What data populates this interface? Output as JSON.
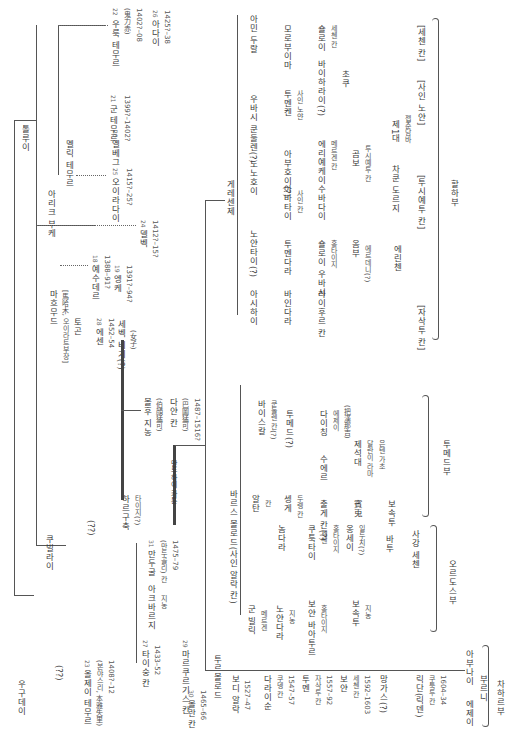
{
  "diagram": {
    "type": "genealogy-tree",
    "orientation": "rotated-90",
    "root": "톨루이",
    "nodes": {
      "tolui": "톨루이",
      "arik_boke": "아리크 부케",
      "melik_temur": "멜릭 테무르",
      "yesuder": {
        "num": "18",
        "name": "예수데르",
        "years": "1388–91?"
      },
      "engke": {
        "num": "19",
        "name": "엥케",
        "years": "1391?–94?"
      },
      "elbeg": {
        "num": "20",
        "name": "엘베그"
      },
      "gun_temur": {
        "num": "21",
        "name": "군 테무르",
        "years": "1399?–1402?"
      },
      "oljei_temur_g": {
        "num": "22",
        "name": "우룩 테무르",
        "sub": "(鬼力赤)",
        "years": "1402?–08"
      },
      "adai": {
        "num": "26",
        "name": "아다이",
        "years": "1425?–38"
      },
      "delbeg": {
        "num": "24",
        "name": "델벡",
        "years": "1412?–15?"
      },
      "oyiradai": {
        "num": "25",
        "name": "오이라다이",
        "years": "1415?–25?"
      },
      "mahmud": {
        "name": "마흐무드",
        "sub": "[馬哈木, 오이라트부장]"
      },
      "toghon": {
        "name": "토곤"
      },
      "esen": {
        "num": "28",
        "name": "에센",
        "years": "1452–54"
      },
      "sebeg_bigi": {
        "name": "세벡 비기(?)",
        "sub": "(女子)"
      },
      "bolhu_jinong": {
        "name": "볼후 지농",
        "sub": "(伯顔猛可)"
      },
      "dayan_khan": {
        "name": "다얀 칸",
        "sub": "(巴圖猛可)",
        "years": "1487–1516?"
      },
      "manduhai": "만두하이 카툰",
      "khubilai": "쿠빌라이",
      "ugedei": "우구데이",
      "q1": "(??)",
      "q2": "(??)",
      "oljei_temur": {
        "num": "23",
        "name": "올제이 테무르",
        "sub": "(본야스리, 本雅失里)",
        "years": "1408?–12"
      },
      "harguchuk": {
        "name": "하르구축",
        "sub": "타이지(?)"
      },
      "manduul": {
        "num": "31",
        "name": "만두굴",
        "sub": "(만두골리) 칸",
        "years": "1475–79"
      },
      "agbarjin": {
        "name": "아크바르지",
        "sub": "지농"
      },
      "taisung": {
        "num": "27",
        "name": "타이숭 칸",
        "years": "1433–52"
      },
      "markorgis": {
        "num": "29",
        "name": "마르쿠르기스 칸"
      },
      "molon": {
        "num": "30",
        "name": "몰란 칸",
        "years": "1465–66"
      },
      "barsbolod": "바르스 볼로드(사인 알락 칸)",
      "torobolod": "투르볼로드",
      "bodi_alag": {
        "name": "보디 알락",
        "years": "1527–47"
      },
      "daraisun": {
        "name": "다라이순",
        "sub": "쿠뎅 칸",
        "years": "1547–57"
      },
      "tumen": {
        "name": "투멘",
        "sub": "자삭투 칸",
        "years": "1557–92"
      },
      "buyan": {
        "name": "보얀",
        "sub": "세첸 칸",
        "years": "1592–1603"
      },
      "mangus": "망가스(?)",
      "ligdan": {
        "name": "릭단(릭덴)",
        "sub": "쿠툭투 칸",
        "years": "1604–34"
      },
      "eje": "에제이",
      "abunai": "아부나이",
      "burni": "부르니",
      "chahar": "차하르부",
      "gun_bilig": {
        "name": "군 빌릭",
        "sub": "메르겐"
      },
      "noyandara": {
        "name": "노얀다라",
        "sub": "지농"
      },
      "nomdara": "놈다라",
      "buyan_bagatur": {
        "name": "보얀 바아투르",
        "sub": "홍타이지"
      },
      "khutugtai": {
        "name": "쿠툭타이",
        "sub": "세첸",
        "sub2": "홍타이지"
      },
      "boshugtu": {
        "name": "보속투",
        "sub": "지농"
      },
      "ongjei": {
        "name": "옹세이",
        "sub": "일두치(?)"
      },
      "bakhu": "바투",
      "sagang": "사강 세첸",
      "ordos": "오르도스부",
      "alchu": {
        "name": "알추",
        "sub": "칸"
      },
      "bayaskhan": {
        "name": "바이스칼",
        "sub": "쿤둘렌 칸(?)"
      },
      "altan": {
        "name": "알탄",
        "sub": "칸"
      },
      "sengge": {
        "name": "셍게",
        "sub": "두렝 칸"
      },
      "tumed_q": "투메드(?)",
      "chokhur": "출게 칸(?)",
      "sutei": "수에르",
      "dayichin": {
        "name": "다이칭",
        "sub": "에제이",
        "sub2": "(把漢那吉)"
      },
      "jesed": {
        "name": "제석대",
        "sub": "달란이 라마",
        "sub2": "은텐 가초"
      },
      "bushu": "賓兎",
      "boshugtu2": "보속투",
      "tumed": "투메드부",
      "gere_senje": "게레센제",
      "ashikhai": "아시하이",
      "noyantai": "노얀타이(?)",
      "nonokhoi": "노노호이",
      "amin_durag": "아민 두랄",
      "ubashi_khong": "우바시 쿤둘렌(?)",
      "bayindara": "바인다라",
      "tumendara": "투멘다라",
      "laikhor": "라이후르 칸",
      "sholoi": {
        "name": "숄로이 우바시",
        "sub": "홍타이지"
      },
      "ombo": {
        "name": "옴부",
        "sub": "에르데니(?)"
      },
      "erinchen": "에린첸",
      "jasagtu_q": "[자삭투 칸]",
      "abatai": {
        "name": "아바타이",
        "sub": "사인 칸"
      },
      "suldai": "수바다이",
      "eriyekhei": {
        "name": "에리예케이",
        "sub": "메르겐 칸"
      },
      "gombo": {
        "name": "곰보",
        "sub": "투시예투 칸"
      },
      "chakhundorji": "차쿤 도르지",
      "tushiyetu": "[투시예투 칸]",
      "jebtsundamba": {
        "name": "제1대",
        "sub": "젭춘담바"
      },
      "abukhui": "아부호이(?)",
      "tumengken": {
        "name": "투멘켄",
        "sub": "사인 노얀"
      },
      "sain_noyan": "[사인 노얀]",
      "baikharai": "바이하라이(?)",
      "chokhu": "초쿠",
      "morobuima": "모로부이마",
      "sholoi_sechen": {
        "name": "숄로이",
        "sub": "세첸 칸"
      },
      "sechen_q": "[세첸 칸]",
      "khalkha": "할하부"
    }
  }
}
